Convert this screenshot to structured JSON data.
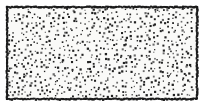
{
  "figure": {
    "kind": "stipple-filled-rectangle",
    "canvas": {
      "width": 202,
      "height": 106,
      "background_color": "#ffffff"
    },
    "rectangle": {
      "left": 6,
      "top": 6,
      "right": 196,
      "bottom": 98,
      "width": 190,
      "height": 92,
      "fill_color": "#fafaf8",
      "border_color": "#1a1a1a",
      "border_width": 2,
      "border_style": "irregular-ink-line",
      "border_jitter": 0.9
    },
    "stipple": {
      "dot_color": "#222222",
      "dot_color_light": "#6b6b6b",
      "dot_min_size": 1.1,
      "dot_max_size": 2.3,
      "grid_spacing": 4.55,
      "jitter": 1.85,
      "fill_probability": 0.9,
      "approx_dot_count": 830,
      "inset": 2,
      "seed": 20240917
    },
    "marks": [
      {
        "name": "stray-ink-stroke",
        "x": 168,
        "y": 78,
        "length": 6,
        "angle_deg": 58,
        "color": "#2a2a2a"
      }
    ]
  },
  "labels": {
    "figure_title": "",
    "caption": "",
    "alt_text": "Dense random dot (stipple) texture filling a bordered rectangle"
  }
}
